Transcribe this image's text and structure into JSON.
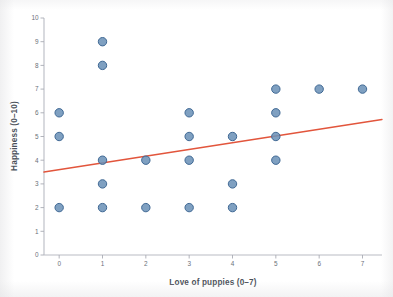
{
  "chart_data": {
    "type": "scatter",
    "title": "",
    "xlabel": "Love of puppies (0–7)",
    "ylabel": "Happiness (0–10)",
    "xlim": [
      -0.35,
      7.45
    ],
    "ylim": [
      0,
      10
    ],
    "xticks": [
      "0",
      "1",
      "2",
      "3",
      "4",
      "5",
      "6",
      "7"
    ],
    "xtick_values": [
      0,
      1,
      2,
      3,
      4,
      5,
      6,
      7
    ],
    "yticks": [
      "0",
      "1",
      "2",
      "3",
      "4",
      "5",
      "6",
      "7",
      "8",
      "9",
      "10"
    ],
    "ytick_values": [
      0,
      1,
      2,
      3,
      4,
      5,
      6,
      7,
      8,
      9,
      10
    ],
    "grid": false,
    "legend": false,
    "legend_position": "none",
    "marker_color": "#6d93b8",
    "marker_edge_color": "#3f6894",
    "trendline_color": "#e2553c",
    "axis_color": "#b9bcc4",
    "points": [
      {
        "x": 0,
        "y": 6
      },
      {
        "x": 0,
        "y": 5
      },
      {
        "x": 0,
        "y": 2
      },
      {
        "x": 1,
        "y": 9
      },
      {
        "x": 1,
        "y": 8
      },
      {
        "x": 1,
        "y": 4
      },
      {
        "x": 1,
        "y": 3
      },
      {
        "x": 1,
        "y": 2
      },
      {
        "x": 2,
        "y": 4
      },
      {
        "x": 2,
        "y": 2
      },
      {
        "x": 3,
        "y": 6
      },
      {
        "x": 3,
        "y": 5
      },
      {
        "x": 3,
        "y": 4
      },
      {
        "x": 3,
        "y": 2
      },
      {
        "x": 4,
        "y": 5
      },
      {
        "x": 4,
        "y": 3
      },
      {
        "x": 4,
        "y": 2
      },
      {
        "x": 5,
        "y": 7
      },
      {
        "x": 5,
        "y": 6
      },
      {
        "x": 5,
        "y": 5
      },
      {
        "x": 5,
        "y": 4
      },
      {
        "x": 6,
        "y": 7
      },
      {
        "x": 7,
        "y": 7
      }
    ],
    "trendline": {
      "x0": -0.35,
      "y0": 3.5,
      "x1": 7.45,
      "y1": 5.72
    }
  }
}
